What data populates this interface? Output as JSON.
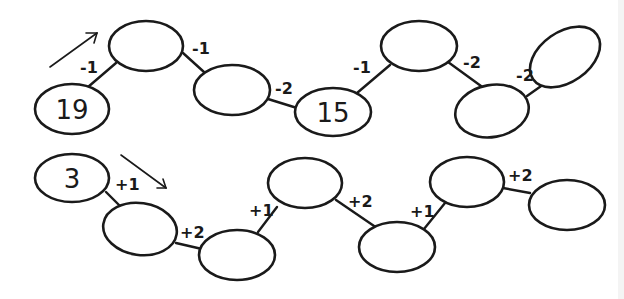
{
  "diagram": {
    "rows": [
      {
        "id": "top",
        "direction_arrow": "up-right",
        "start_value": "19",
        "nodes": [
          {
            "value": "19"
          },
          {
            "value": ""
          },
          {
            "value": ""
          },
          {
            "value": "15"
          },
          {
            "value": ""
          },
          {
            "value": ""
          },
          {
            "value": ""
          }
        ],
        "steps": [
          "-1",
          "-1",
          "-2",
          "-1",
          "-2",
          "-2"
        ]
      },
      {
        "id": "bottom",
        "direction_arrow": "down-right",
        "start_value": "3",
        "nodes": [
          {
            "value": "3"
          },
          {
            "value": ""
          },
          {
            "value": ""
          },
          {
            "value": ""
          },
          {
            "value": ""
          },
          {
            "value": ""
          },
          {
            "value": ""
          }
        ],
        "steps": [
          "+1",
          "+2",
          "+1",
          "+2",
          "+1",
          "+2"
        ]
      }
    ]
  }
}
